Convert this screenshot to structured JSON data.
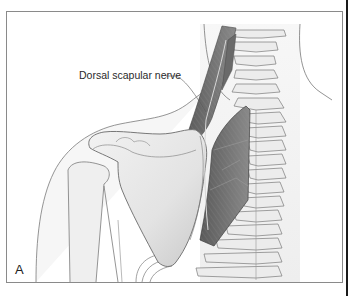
{
  "figure": {
    "panel_label": "A",
    "annotations": [
      {
        "text": "Dorsal scapular nerve",
        "target": "nerve along levator scapulae / rhomboids"
      }
    ],
    "structures": [
      "neck",
      "shoulder",
      "scapula",
      "humerus",
      "cervical and thoracic spine",
      "ribs",
      "levator scapulae",
      "rhomboid muscles",
      "dorsal scapular nerve"
    ]
  },
  "colors": {
    "frame_border": "#8a8a8a",
    "outline": "#6f6f6f",
    "muscle": "#6e6e6e",
    "muscle_dark": "#4e4e4e",
    "bone": "#e6e6e6",
    "skin_fill": "#f4f4f4"
  }
}
